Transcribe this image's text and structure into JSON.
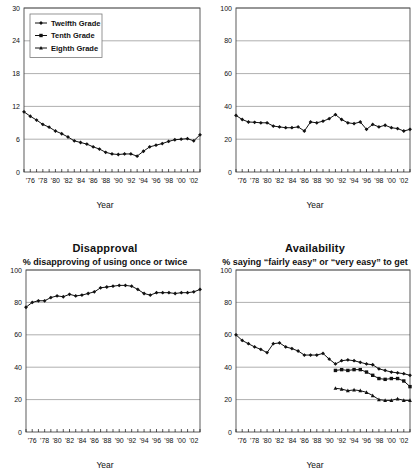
{
  "figure": {
    "width": 420,
    "height": 475,
    "background": "#ffffff",
    "line_color": "#111111",
    "grid_color": "#9a9a9a",
    "frame_color": "#4a4a4a"
  },
  "legend": {
    "entries": [
      {
        "label": "Twelfth Grade",
        "marker": "diamond-cross-marker"
      },
      {
        "label": "Tenth Grade",
        "marker": "square-marker"
      },
      {
        "label": "Eighth Grade",
        "marker": "triangle-cross-marker"
      }
    ]
  },
  "xaxis": {
    "title": "Year",
    "tick_labels": [
      "'76",
      "'78",
      "'80",
      "'82",
      "'84",
      "'86",
      "'88",
      "'90",
      "'92",
      "'94",
      "'96",
      "'98",
      "'00",
      "'02"
    ],
    "tick_years": [
      1976,
      1978,
      1980,
      1982,
      1984,
      1986,
      1988,
      1990,
      1992,
      1994,
      1996,
      1998,
      2000,
      2002
    ],
    "min": 1975,
    "max": 2003
  },
  "chart_data": [
    {
      "id": "panel-top-left",
      "type": "line",
      "title": "",
      "subtitle": "",
      "xlabel": "Year",
      "ylabel": "",
      "ylim": [
        0,
        30
      ],
      "yticks": [
        0,
        6,
        12,
        18,
        24,
        30
      ],
      "grid": true,
      "legend_position": "top-left-inside",
      "x": [
        1975,
        1976,
        1977,
        1978,
        1979,
        1980,
        1981,
        1982,
        1983,
        1984,
        1985,
        1986,
        1987,
        1988,
        1989,
        1990,
        1991,
        1992,
        1993,
        1994,
        1995,
        1996,
        1997,
        1998,
        1999,
        2000,
        2001,
        2002,
        2003
      ],
      "series": [
        {
          "name": "Twelfth Grade",
          "values": [
            11.0,
            10.2,
            9.5,
            8.7,
            8.2,
            7.5,
            7.0,
            6.4,
            5.7,
            5.4,
            5.1,
            4.6,
            4.2,
            3.6,
            3.3,
            3.2,
            3.3,
            3.3,
            2.9,
            3.8,
            4.6,
            4.9,
            5.2,
            5.6,
            5.9,
            6.0,
            6.1,
            5.7,
            6.8
          ]
        }
      ]
    },
    {
      "id": "panel-top-right",
      "type": "line",
      "title": "",
      "subtitle": "",
      "xlabel": "Year",
      "ylabel": "",
      "ylim": [
        0,
        100
      ],
      "yticks": [
        0,
        20,
        40,
        60,
        80,
        100
      ],
      "grid": true,
      "legend_position": "none",
      "x": [
        1975,
        1976,
        1977,
        1978,
        1979,
        1980,
        1981,
        1982,
        1983,
        1984,
        1985,
        1986,
        1987,
        1988,
        1989,
        1990,
        1991,
        1992,
        1993,
        1994,
        1995,
        1996,
        1997,
        1998,
        1999,
        2000,
        2001,
        2002,
        2003
      ],
      "series": [
        {
          "name": "Twelfth Grade",
          "values": [
            34.5,
            32.0,
            30.5,
            30.3,
            30.0,
            30.0,
            28.0,
            27.5,
            27.0,
            27.0,
            27.5,
            25.0,
            30.5,
            30.0,
            31.0,
            32.5,
            35.0,
            32.0,
            30.0,
            29.5,
            30.5,
            26.0,
            29.0,
            27.5,
            28.5,
            27.0,
            26.5,
            25.0,
            26.0
          ]
        }
      ]
    },
    {
      "id": "panel-bottom-left",
      "type": "line",
      "title": "Disapproval",
      "subtitle": "% disapproving of using once or twice",
      "xlabel": "Year",
      "ylabel": "",
      "ylim": [
        0,
        100
      ],
      "yticks": [
        0,
        20,
        40,
        60,
        80,
        100
      ],
      "grid": true,
      "legend_position": "none",
      "x": [
        1975,
        1976,
        1977,
        1978,
        1979,
        1980,
        1981,
        1982,
        1983,
        1984,
        1985,
        1986,
        1987,
        1988,
        1989,
        1990,
        1991,
        1992,
        1993,
        1994,
        1995,
        1996,
        1997,
        1998,
        1999,
        2000,
        2001,
        2002,
        2003
      ],
      "series": [
        {
          "name": "Twelfth Grade",
          "values": [
            77.0,
            80.0,
            81.0,
            81.0,
            83.0,
            84.0,
            83.5,
            85.0,
            84.0,
            84.5,
            85.5,
            86.5,
            89.0,
            89.5,
            90.0,
            90.5,
            90.5,
            90.0,
            88.0,
            85.5,
            84.5,
            86.0,
            86.0,
            86.0,
            85.5,
            86.0,
            86.0,
            86.5,
            88.0
          ]
        }
      ]
    },
    {
      "id": "panel-bottom-right",
      "type": "line",
      "title": "Availability",
      "subtitle": "% saying “fairly easy” or “very easy” to get",
      "xlabel": "Year",
      "ylabel": "",
      "ylim": [
        0,
        100
      ],
      "yticks": [
        0,
        20,
        40,
        60,
        80,
        100
      ],
      "grid": true,
      "legend_position": "none",
      "x": [
        1975,
        1976,
        1977,
        1978,
        1979,
        1980,
        1981,
        1982,
        1983,
        1984,
        1985,
        1986,
        1987,
        1988,
        1989,
        1990,
        1991,
        1992,
        1993,
        1994,
        1995,
        1996,
        1997,
        1998,
        1999,
        2000,
        2001,
        2002,
        2003
      ],
      "series": [
        {
          "name": "Twelfth Grade",
          "values": [
            60.0,
            56.5,
            54.5,
            52.5,
            51.0,
            49.0,
            54.5,
            55.0,
            52.5,
            51.5,
            50.0,
            47.5,
            47.5,
            47.5,
            48.5,
            45.0,
            42.0,
            44.0,
            44.5,
            44.0,
            43.0,
            42.0,
            41.5,
            39.0,
            38.0,
            37.0,
            36.5,
            36.0,
            35.0
          ]
        },
        {
          "name": "Tenth Grade",
          "values": [
            null,
            null,
            null,
            null,
            null,
            null,
            null,
            null,
            null,
            null,
            null,
            null,
            null,
            null,
            null,
            null,
            38.0,
            38.5,
            38.0,
            38.5,
            38.5,
            37.0,
            35.0,
            33.0,
            32.5,
            33.0,
            33.0,
            31.5,
            28.0
          ]
        },
        {
          "name": "Eighth Grade",
          "values": [
            null,
            null,
            null,
            null,
            null,
            null,
            null,
            null,
            null,
            null,
            null,
            null,
            null,
            null,
            null,
            null,
            27.0,
            26.5,
            25.5,
            26.0,
            25.5,
            24.5,
            22.5,
            20.0,
            19.5,
            19.5,
            20.5,
            19.5,
            19.5
          ]
        }
      ]
    }
  ]
}
